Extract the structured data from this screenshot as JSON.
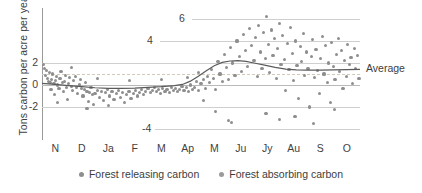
{
  "chart_data": {
    "type": "scatter",
    "title": "",
    "xlabel": "",
    "ylabel": "Tons carbon per acre per year",
    "ylim": [
      -5,
      7
    ],
    "xlim": [
      0,
      12
    ],
    "grid": true,
    "legend_position": "bottom-center",
    "y_ticks_axis": [
      "2",
      "0",
      "-2"
    ],
    "y_ticks_inline": [
      "6",
      "4",
      "-4"
    ],
    "categories": [
      "N",
      "D",
      "Ja",
      "F",
      "M",
      "Ap",
      "M",
      "Ju",
      "Jy",
      "Au",
      "S",
      "O"
    ],
    "annotation_average": "Average",
    "legend": [
      {
        "label": "Forest releasing carbon",
        "color": "#8e8e8e"
      },
      {
        "label": "Forest absorbing carbon",
        "color": "#9a9a9a"
      }
    ],
    "series": [
      {
        "name": "Daily net carbon flux",
        "color": "#8e8e8e",
        "points": [
          [
            0.05,
            1.9
          ],
          [
            0.1,
            1.5
          ],
          [
            0.13,
            0.9
          ],
          [
            0.16,
            1.3
          ],
          [
            0.2,
            0.6
          ],
          [
            0.24,
            0.3
          ],
          [
            0.27,
            1.1
          ],
          [
            0.3,
            0.2
          ],
          [
            0.34,
            -0.4
          ],
          [
            0.37,
            0.5
          ],
          [
            0.41,
            1.0
          ],
          [
            0.45,
            0.1
          ],
          [
            0.48,
            -0.9
          ],
          [
            0.52,
            0.4
          ],
          [
            0.56,
            0.8
          ],
          [
            0.6,
            0.0
          ],
          [
            0.64,
            -0.3
          ],
          [
            0.68,
            0.6
          ],
          [
            0.72,
            1.2
          ],
          [
            0.76,
            0.2
          ],
          [
            0.8,
            -0.6
          ],
          [
            0.84,
            0.3
          ],
          [
            0.88,
            0.9
          ],
          [
            0.92,
            -0.2
          ],
          [
            0.96,
            -1.3
          ],
          [
            1.0,
            0.1
          ],
          [
            1.05,
            0.7
          ],
          [
            1.1,
            -0.1
          ],
          [
            1.15,
            -0.5
          ],
          [
            1.2,
            0.4
          ],
          [
            1.25,
            0.8
          ],
          [
            1.3,
            -0.2
          ],
          [
            1.35,
            -0.8
          ],
          [
            1.4,
            0.0
          ],
          [
            1.45,
            0.5
          ],
          [
            1.5,
            -0.3
          ],
          [
            1.55,
            -1.0
          ],
          [
            1.6,
            -0.4
          ],
          [
            1.65,
            0.2
          ],
          [
            1.7,
            -0.6
          ],
          [
            1.75,
            -1.5
          ],
          [
            1.8,
            -0.7
          ],
          [
            1.85,
            -0.2
          ],
          [
            1.9,
            -0.9
          ],
          [
            1.95,
            -1.8
          ],
          [
            2.0,
            -0.8
          ],
          [
            2.08,
            -0.5
          ],
          [
            2.16,
            -1.1
          ],
          [
            2.24,
            -0.6
          ],
          [
            2.32,
            -1.4
          ],
          [
            2.4,
            -0.7
          ],
          [
            2.48,
            -0.4
          ],
          [
            2.56,
            -1.0
          ],
          [
            2.64,
            -0.6
          ],
          [
            2.72,
            -1.3
          ],
          [
            2.8,
            -0.8
          ],
          [
            2.88,
            -0.5
          ],
          [
            2.96,
            -1.1
          ],
          [
            3.04,
            -0.7
          ],
          [
            3.12,
            -1.6
          ],
          [
            3.2,
            -0.9
          ],
          [
            3.28,
            -0.6
          ],
          [
            3.36,
            -1.2
          ],
          [
            3.44,
            -0.8
          ],
          [
            3.52,
            -0.5
          ],
          [
            3.6,
            -1.0
          ],
          [
            3.68,
            -0.7
          ],
          [
            3.76,
            -0.4
          ],
          [
            3.84,
            -0.9
          ],
          [
            3.92,
            -0.6
          ],
          [
            4.0,
            -0.3
          ],
          [
            4.08,
            -0.7
          ],
          [
            4.16,
            -0.5
          ],
          [
            4.24,
            -0.2
          ],
          [
            4.32,
            -0.6
          ],
          [
            4.4,
            -0.4
          ],
          [
            4.48,
            -0.8
          ],
          [
            4.56,
            -0.3
          ],
          [
            4.64,
            -0.6
          ],
          [
            4.72,
            -0.4
          ],
          [
            4.8,
            -0.7
          ],
          [
            4.88,
            -0.2
          ],
          [
            4.96,
            -0.5
          ],
          [
            5.04,
            -0.3
          ],
          [
            5.12,
            -0.6
          ],
          [
            5.2,
            -0.4
          ],
          [
            5.28,
            -0.1
          ],
          [
            5.36,
            -0.5
          ],
          [
            5.44,
            -0.2
          ],
          [
            5.52,
            -0.6
          ],
          [
            5.6,
            0.0
          ],
          [
            5.68,
            -0.4
          ],
          [
            5.76,
            -0.2
          ],
          [
            5.84,
            0.3
          ],
          [
            5.92,
            -0.5
          ],
          [
            6.0,
            0.1
          ],
          [
            6.08,
            0.5
          ],
          [
            6.16,
            -0.3
          ],
          [
            6.24,
            0.8
          ],
          [
            6.32,
            0.2
          ],
          [
            6.4,
            1.4
          ],
          [
            6.48,
            0.6
          ],
          [
            6.56,
            -0.4
          ],
          [
            6.64,
            2.1
          ],
          [
            6.72,
            1.0
          ],
          [
            6.8,
            0.3
          ],
          [
            6.88,
            2.8
          ],
          [
            6.96,
            1.6
          ],
          [
            7.04,
            0.5
          ],
          [
            7.12,
            3.4
          ],
          [
            7.2,
            2.0
          ],
          [
            7.28,
            0.9
          ],
          [
            7.36,
            4.0
          ],
          [
            7.44,
            2.6
          ],
          [
            7.52,
            1.2
          ],
          [
            7.6,
            4.6
          ],
          [
            7.68,
            3.1
          ],
          [
            7.76,
            1.7
          ],
          [
            7.84,
            5.1
          ],
          [
            7.92,
            3.6
          ],
          [
            8.0,
            2.2
          ],
          [
            8.06,
            4.3
          ],
          [
            8.12,
            0.8
          ],
          [
            8.18,
            5.4
          ],
          [
            8.24,
            3.0
          ],
          [
            8.3,
            1.5
          ],
          [
            8.36,
            4.8
          ],
          [
            8.42,
            2.4
          ],
          [
            8.48,
            6.2
          ],
          [
            8.54,
            3.7
          ],
          [
            8.6,
            1.1
          ],
          [
            8.66,
            5.0
          ],
          [
            8.72,
            2.7
          ],
          [
            8.78,
            4.2
          ],
          [
            8.84,
            0.6
          ],
          [
            8.9,
            3.3
          ],
          [
            8.96,
            5.6
          ],
          [
            9.02,
            1.9
          ],
          [
            9.08,
            4.5
          ],
          [
            9.14,
            2.3
          ],
          [
            9.2,
            -0.5
          ],
          [
            9.26,
            3.8
          ],
          [
            9.32,
            1.4
          ],
          [
            9.38,
            5.2
          ],
          [
            9.44,
            2.9
          ],
          [
            9.5,
            0.4
          ],
          [
            9.56,
            4.0
          ],
          [
            9.62,
            1.8
          ],
          [
            9.68,
            -1.2
          ],
          [
            9.74,
            3.5
          ],
          [
            9.8,
            2.1
          ],
          [
            9.86,
            4.7
          ],
          [
            9.92,
            0.9
          ],
          [
            9.98,
            3.0
          ],
          [
            10.04,
            1.5
          ],
          [
            10.1,
            -2.0
          ],
          [
            10.16,
            2.6
          ],
          [
            10.22,
            4.1
          ],
          [
            10.28,
            0.7
          ],
          [
            10.34,
            3.2
          ],
          [
            10.4,
            1.3
          ],
          [
            10.46,
            -0.8
          ],
          [
            10.52,
            2.4
          ],
          [
            10.58,
            4.4
          ],
          [
            10.64,
            1.0
          ],
          [
            10.7,
            3.6
          ],
          [
            10.76,
            0.2
          ],
          [
            10.82,
            2.0
          ],
          [
            10.88,
            -1.6
          ],
          [
            10.94,
            3.9
          ],
          [
            11.0,
            1.7
          ],
          [
            11.06,
            0.5
          ],
          [
            11.12,
            2.8
          ],
          [
            11.18,
            4.2
          ],
          [
            11.24,
            1.2
          ],
          [
            11.3,
            3.1
          ],
          [
            11.36,
            -0.3
          ],
          [
            11.42,
            2.2
          ],
          [
            11.48,
            0.8
          ],
          [
            11.54,
            3.7
          ],
          [
            11.6,
            1.9
          ],
          [
            11.66,
            2.5
          ],
          [
            11.72,
            0.1
          ],
          [
            11.78,
            3.3
          ],
          [
            11.84,
            1.5
          ],
          [
            11.9,
            2.7
          ],
          [
            11.96,
            0.6
          ],
          [
            7.05,
            -3.2
          ],
          [
            7.15,
            -3.4
          ],
          [
            8.45,
            -2.6
          ],
          [
            8.95,
            -3.1
          ],
          [
            9.55,
            -2.9
          ],
          [
            10.25,
            -3.5
          ],
          [
            6.55,
            -2.4
          ],
          [
            11.05,
            -2.2
          ],
          [
            2.1,
            0.6
          ],
          [
            3.3,
            0.4
          ],
          [
            4.5,
            0.5
          ],
          [
            5.5,
            0.7
          ],
          [
            1.1,
            1.6
          ],
          [
            0.6,
            -1.6
          ],
          [
            1.7,
            -2.1
          ],
          [
            2.5,
            -1.9
          ],
          [
            5.9,
            1.1
          ],
          [
            6.1,
            -1.4
          ]
        ]
      }
    ],
    "average_line": {
      "name": "Average",
      "color": "#5a5a5a",
      "points": [
        [
          0.0,
          0.15
        ],
        [
          0.5,
          0.05
        ],
        [
          1.0,
          -0.05
        ],
        [
          1.5,
          -0.15
        ],
        [
          2.0,
          -0.25
        ],
        [
          2.5,
          -0.3
        ],
        [
          3.0,
          -0.3
        ],
        [
          3.5,
          -0.28
        ],
        [
          4.0,
          -0.22
        ],
        [
          4.5,
          -0.15
        ],
        [
          5.0,
          -0.05
        ],
        [
          5.3,
          0.05
        ],
        [
          5.6,
          0.35
        ],
        [
          5.9,
          0.8
        ],
        [
          6.2,
          1.3
        ],
        [
          6.5,
          1.75
        ],
        [
          6.8,
          2.05
        ],
        [
          7.1,
          2.18
        ],
        [
          7.4,
          2.22
        ],
        [
          7.7,
          2.15
        ],
        [
          8.0,
          2.0
        ],
        [
          8.4,
          1.8
        ],
        [
          8.8,
          1.6
        ],
        [
          9.2,
          1.45
        ],
        [
          9.6,
          1.38
        ],
        [
          10.0,
          1.35
        ],
        [
          10.5,
          1.35
        ],
        [
          11.0,
          1.38
        ],
        [
          11.5,
          1.4
        ],
        [
          12.0,
          1.42
        ]
      ]
    }
  }
}
